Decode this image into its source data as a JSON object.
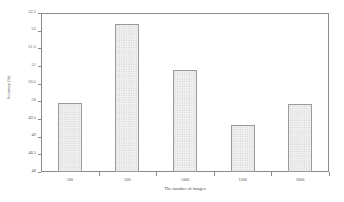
{
  "chart_data": {
    "type": "bar",
    "title": "",
    "subtitle": "",
    "xlabel": "The number of images",
    "ylabel": "Accuracy (%)",
    "categories": [
      "100",
      "500",
      "1000",
      "1500",
      "2000"
    ],
    "values": [
      49.95,
      52.18,
      50.88,
      49.33,
      49.92
    ],
    "ylim": [
      48,
      52.5
    ],
    "yticks": [
      "48",
      "48.5",
      "49",
      "49.5",
      "50",
      "50.5",
      "51",
      "51.5",
      "52",
      "52.5"
    ],
    "ytick_values": [
      48,
      48.5,
      49,
      49.5,
      50,
      50.5,
      51,
      51.5,
      52,
      52.5
    ],
    "grid": false,
    "legend": false,
    "legend_position": "none",
    "series": [
      {
        "name": "Accuracy",
        "values": [
          49.95,
          52.18,
          50.88,
          49.33,
          49.92
        ]
      }
    ],
    "bar_fill_color": "#f1f1f1",
    "bar_edge_color": "#9a9a9a",
    "axis_color": "#8a8a8a",
    "background_color": "#ffffff"
  }
}
